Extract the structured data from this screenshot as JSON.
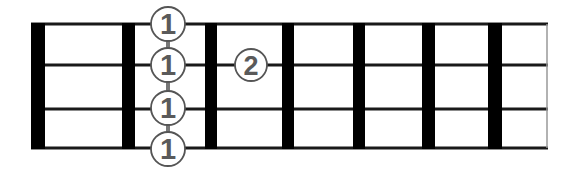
{
  "diagram": {
    "type": "chord-fretboard",
    "strings": 4,
    "frets_shown": 7,
    "colors": {
      "fret": "#000000",
      "string": "#1a1a1a",
      "marker_outline": "#555555",
      "marker_digit": "#5a5a5a",
      "barre": "#777777"
    },
    "markers": [
      {
        "finger": "1",
        "string": 1,
        "fret": 1
      },
      {
        "finger": "1",
        "string": 2,
        "fret": 1
      },
      {
        "finger": "1",
        "string": 3,
        "fret": 1
      },
      {
        "finger": "1",
        "string": 4,
        "fret": 1
      },
      {
        "finger": "2",
        "string": 2,
        "fret": 2
      }
    ]
  }
}
